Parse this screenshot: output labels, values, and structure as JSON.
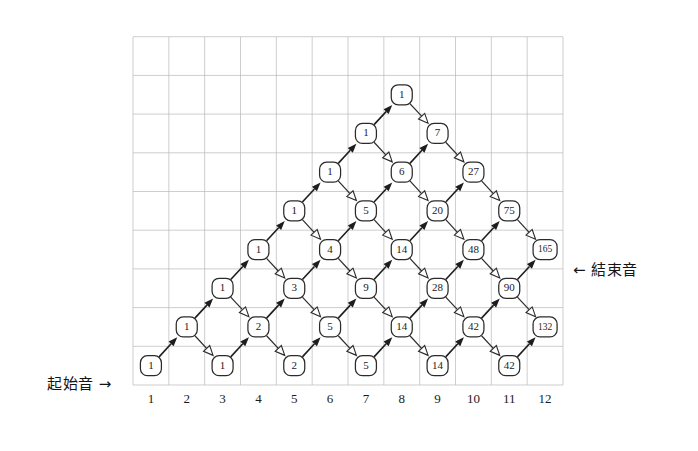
{
  "figure": {
    "type": "lattice-diagram",
    "start_label": "起始音 →",
    "end_label": "← 結束音"
  },
  "grid": {
    "columns": 12,
    "rows": 9,
    "x_start": 133,
    "x_end": 563,
    "y_start": 37,
    "y_end": 385,
    "col_step": 35.83,
    "row_step": 38.7,
    "line_color": "#b9b9b9"
  },
  "axis": {
    "ticks": [
      "1",
      "2",
      "3",
      "4",
      "5",
      "6",
      "7",
      "8",
      "9",
      "10",
      "11",
      "12"
    ],
    "tick_y": 403
  },
  "chart_data": {
    "type": "table",
    "title": "",
    "xlabel": "",
    "ylabel": "",
    "nodes": [
      {
        "col": 1,
        "row": 1,
        "value": "1"
      },
      {
        "col": 3,
        "row": 1,
        "value": "1"
      },
      {
        "col": 5,
        "row": 1,
        "value": "2"
      },
      {
        "col": 7,
        "row": 1,
        "value": "5"
      },
      {
        "col": 9,
        "row": 1,
        "value": "14"
      },
      {
        "col": 11,
        "row": 1,
        "value": "42"
      },
      {
        "col": 2,
        "row": 2,
        "value": "1"
      },
      {
        "col": 4,
        "row": 2,
        "value": "2"
      },
      {
        "col": 6,
        "row": 2,
        "value": "5"
      },
      {
        "col": 8,
        "row": 2,
        "value": "14"
      },
      {
        "col": 10,
        "row": 2,
        "value": "42"
      },
      {
        "col": 12,
        "row": 2,
        "value": "132"
      },
      {
        "col": 3,
        "row": 3,
        "value": "1"
      },
      {
        "col": 5,
        "row": 3,
        "value": "3"
      },
      {
        "col": 7,
        "row": 3,
        "value": "9"
      },
      {
        "col": 9,
        "row": 3,
        "value": "28"
      },
      {
        "col": 11,
        "row": 3,
        "value": "90"
      },
      {
        "col": 4,
        "row": 4,
        "value": "1"
      },
      {
        "col": 6,
        "row": 4,
        "value": "4"
      },
      {
        "col": 8,
        "row": 4,
        "value": "14"
      },
      {
        "col": 10,
        "row": 4,
        "value": "48"
      },
      {
        "col": 12,
        "row": 4,
        "value": "165"
      },
      {
        "col": 5,
        "row": 5,
        "value": "1"
      },
      {
        "col": 7,
        "row": 5,
        "value": "5"
      },
      {
        "col": 9,
        "row": 5,
        "value": "20"
      },
      {
        "col": 11,
        "row": 5,
        "value": "75"
      },
      {
        "col": 6,
        "row": 6,
        "value": "1"
      },
      {
        "col": 8,
        "row": 6,
        "value": "6"
      },
      {
        "col": 10,
        "row": 6,
        "value": "27"
      },
      {
        "col": 7,
        "row": 7,
        "value": "1"
      },
      {
        "col": 9,
        "row": 7,
        "value": "7"
      },
      {
        "col": 8,
        "row": 8,
        "value": "1"
      }
    ],
    "edges_up": [
      [
        1,
        1,
        2,
        2
      ],
      [
        3,
        1,
        4,
        2
      ],
      [
        5,
        1,
        6,
        2
      ],
      [
        7,
        1,
        8,
        2
      ],
      [
        9,
        1,
        10,
        2
      ],
      [
        11,
        1,
        12,
        2
      ],
      [
        2,
        2,
        3,
        3
      ],
      [
        4,
        2,
        5,
        3
      ],
      [
        6,
        2,
        7,
        3
      ],
      [
        8,
        2,
        9,
        3
      ],
      [
        10,
        2,
        11,
        3
      ],
      [
        3,
        3,
        4,
        4
      ],
      [
        5,
        3,
        6,
        4
      ],
      [
        7,
        3,
        8,
        4
      ],
      [
        9,
        3,
        10,
        4
      ],
      [
        11,
        3,
        12,
        4
      ],
      [
        4,
        4,
        5,
        5
      ],
      [
        6,
        4,
        7,
        5
      ],
      [
        8,
        4,
        9,
        5
      ],
      [
        10,
        4,
        11,
        5
      ],
      [
        5,
        5,
        6,
        6
      ],
      [
        7,
        5,
        8,
        6
      ],
      [
        9,
        5,
        10,
        6
      ],
      [
        6,
        6,
        7,
        7
      ],
      [
        8,
        6,
        9,
        7
      ],
      [
        7,
        7,
        8,
        8
      ]
    ],
    "edges_down": [
      [
        2,
        2,
        3,
        1
      ],
      [
        4,
        2,
        5,
        1
      ],
      [
        6,
        2,
        7,
        1
      ],
      [
        8,
        2,
        9,
        1
      ],
      [
        10,
        2,
        11,
        1
      ],
      [
        3,
        3,
        4,
        2
      ],
      [
        5,
        3,
        6,
        2
      ],
      [
        7,
        3,
        8,
        2
      ],
      [
        9,
        3,
        10,
        2
      ],
      [
        11,
        3,
        12,
        2
      ],
      [
        4,
        4,
        5,
        3
      ],
      [
        6,
        4,
        7,
        3
      ],
      [
        8,
        4,
        9,
        3
      ],
      [
        10,
        4,
        11,
        3
      ],
      [
        5,
        5,
        6,
        4
      ],
      [
        7,
        5,
        8,
        4
      ],
      [
        9,
        5,
        10,
        4
      ],
      [
        11,
        5,
        12,
        4
      ],
      [
        6,
        6,
        7,
        5
      ],
      [
        8,
        6,
        9,
        5
      ],
      [
        10,
        6,
        11,
        5
      ],
      [
        7,
        7,
        8,
        6
      ],
      [
        9,
        7,
        10,
        6
      ],
      [
        8,
        8,
        9,
        7
      ]
    ]
  }
}
